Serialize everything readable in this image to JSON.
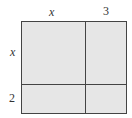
{
  "diagram": {
    "type": "area-model",
    "top_labels": [
      "x",
      "3"
    ],
    "side_labels": [
      "x",
      "2"
    ],
    "fill_color": "#e6e6e6",
    "line_color": "#444444"
  }
}
